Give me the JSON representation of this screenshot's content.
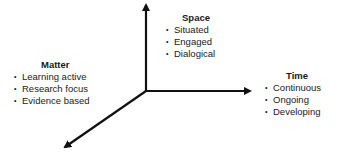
{
  "diagram": {
    "axes": [
      {
        "name": "space-axis",
        "direction": "up"
      },
      {
        "name": "time-axis",
        "direction": "right"
      },
      {
        "name": "matter-axis",
        "direction": "down-left"
      }
    ],
    "groups": {
      "space": {
        "title": "Space",
        "items": [
          "Situated",
          "Engaged",
          "Dialogical"
        ]
      },
      "matter": {
        "title": "Matter",
        "items": [
          "Learning active",
          "Research focus",
          "Evidence based"
        ]
      },
      "time": {
        "title": "Time",
        "items": [
          "Continuous",
          "Ongoing",
          "Developing"
        ]
      }
    },
    "colors": {
      "line": "#111111",
      "text": "#1a1a1a",
      "background": "#ffffff"
    }
  }
}
